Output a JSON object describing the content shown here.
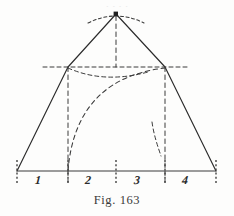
{
  "figure": {
    "caption": "Fig. 163",
    "caption_number": "163",
    "top_cut_text": "·  ·   ·  ·",
    "segment_labels": [
      {
        "text": "1",
        "x": 38,
        "y": 174
      },
      {
        "text": "2",
        "x": 88,
        "y": 174
      },
      {
        "text": "3",
        "x": 137,
        "y": 174
      },
      {
        "text": "4",
        "x": 185,
        "y": 174
      }
    ],
    "colors": {
      "ink": "#2b2b2b",
      "ink_light": "#4a4a4a",
      "paper": "#fdfdfc",
      "caption": "#3a3a3a"
    },
    "geometry": {
      "apex": {
        "x": 116,
        "y": 14
      },
      "left_base_vertex": {
        "x": 17,
        "y": 171
      },
      "right_base_vertex": {
        "x": 216,
        "y": 171
      },
      "left_junction": {
        "x": 68,
        "y": 67
      },
      "right_junction": {
        "x": 165,
        "y": 67
      },
      "baseline_y": 171,
      "horizontal_dashed_y": 67,
      "horizontal_dashed_x1": 43,
      "horizontal_dashed_x2": 190,
      "center_x": 116,
      "tick_positions": [
        17,
        68,
        116,
        165,
        216
      ],
      "tick_bottom_y": 182
    }
  }
}
